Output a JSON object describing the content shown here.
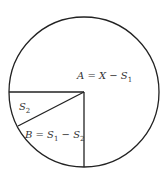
{
  "diagram": {
    "type": "circle-partition",
    "labels": {
      "A": "A = X − S",
      "A_sub": "1",
      "S2": "S",
      "S2_sub": "2",
      "B_prefix": "B = S",
      "B_sub1": "1",
      "B_mid": " − S",
      "B_sub2": "2"
    },
    "colors": {
      "stroke": "#222222",
      "background": "#ffffff"
    }
  }
}
